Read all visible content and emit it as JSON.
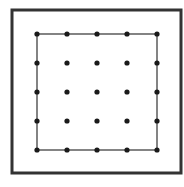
{
  "diagram": {
    "type": "dot-grid-square",
    "background": "#ffffff",
    "outer_frame": {
      "x": 12,
      "y": 10,
      "width": 169,
      "height": 163,
      "stroke": "#333333",
      "stroke_width": 3
    },
    "inner_square": {
      "x": 37,
      "y": 34,
      "width": 120,
      "height": 116,
      "stroke": "#333333",
      "stroke_width": 1.2
    },
    "grid": {
      "rows": 5,
      "cols": 5,
      "x_positions": [
        37,
        67,
        97,
        127,
        157
      ],
      "y_positions": [
        34,
        63,
        92,
        121,
        150
      ],
      "dot_radius": 2.6,
      "dot_color": "#1a1a1a"
    }
  }
}
